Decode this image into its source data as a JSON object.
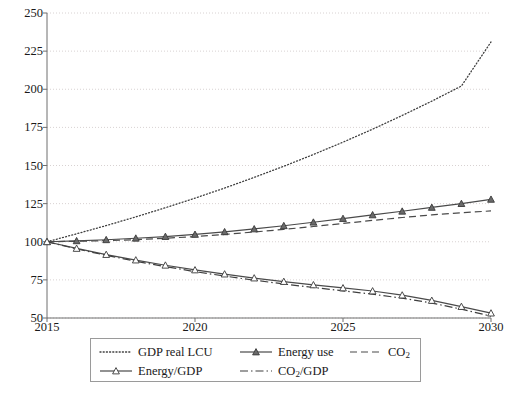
{
  "chart_data": {
    "type": "line",
    "title": "",
    "xlabel": "",
    "ylabel": "",
    "xlim": [
      2015,
      2030
    ],
    "ylim": [
      50,
      250
    ],
    "grid": true,
    "legend_position": "bottom",
    "x": [
      2015,
      2016,
      2017,
      2018,
      2019,
      2020,
      2021,
      2022,
      2023,
      2024,
      2025,
      2026,
      2027,
      2028,
      2029,
      2030
    ],
    "y_ticks": [
      50,
      75,
      100,
      125,
      150,
      175,
      200,
      225,
      250
    ],
    "x_ticks": [
      2015,
      2020,
      2025,
      2030
    ],
    "x_tick_labels": [
      "2015",
      "2020",
      "2025",
      "2030"
    ],
    "series": [
      {
        "name": "GDP real LCU",
        "style": "dotted",
        "marker": "none",
        "color": "#3f3f3f",
        "values": [
          100,
          105.2,
          110.6,
          116.3,
          122.3,
          128.6,
          135.2,
          142.2,
          149.5,
          157.2,
          165.3,
          173.8,
          182.8,
          192.2,
          202.1,
          231.0
        ]
      },
      {
        "name": "Energy use",
        "style": "solid",
        "marker": "filled-triangle",
        "color": "#4a4a4a",
        "values": [
          100,
          100.6,
          101.3,
          102.3,
          103.4,
          104.8,
          106.5,
          108.4,
          110.5,
          112.8,
          115.2,
          117.6,
          120.0,
          122.5,
          125.0,
          127.8
        ]
      },
      {
        "name": "CO2",
        "style": "dashed",
        "marker": "none",
        "color": "#4a4a4a",
        "values": [
          100,
          100.3,
          100.7,
          101.4,
          102.3,
          103.4,
          104.8,
          106.4,
          108.1,
          110.0,
          112.0,
          114.0,
          115.9,
          117.6,
          119.0,
          120.2
        ]
      },
      {
        "name": "Energy/GDP",
        "style": "solid",
        "marker": "open-triangle",
        "color": "#4a4a4a",
        "values": [
          100,
          95.6,
          91.6,
          88.0,
          84.6,
          81.5,
          78.8,
          76.2,
          73.9,
          71.7,
          69.7,
          67.7,
          65.0,
          61.5,
          57.5,
          53.2
        ]
      },
      {
        "name": "CO2/GDP",
        "style": "dash-dot",
        "marker": "none",
        "color": "#3f3f3f",
        "values": [
          100,
          95.3,
          91.1,
          87.2,
          83.7,
          80.4,
          77.5,
          74.8,
          72.3,
          70.0,
          67.8,
          65.6,
          63.0,
          59.8,
          55.8,
          51.2
        ]
      }
    ]
  },
  "axes": {
    "y_tick_labels": [
      "250",
      "225",
      "200",
      "175",
      "150",
      "125",
      "100",
      "75",
      "50"
    ],
    "x_tick_labels": [
      "2015",
      "2020",
      "2025",
      "2030"
    ]
  },
  "legend": {
    "items": [
      {
        "label": "GDP real LCU",
        "key": "dotted-line-key"
      },
      {
        "label": "Energy use",
        "key": "solid-filled-triangle-key"
      },
      {
        "label": "CO",
        "sub": "2",
        "key": "dashed-line-key"
      },
      {
        "label": "Energy/GDP",
        "key": "solid-open-triangle-key"
      },
      {
        "label": "CO",
        "sub": "2",
        "suffix": "/GDP",
        "key": "dash-dot-line-key"
      }
    ]
  },
  "colors": {
    "axis": "#6e6e6e",
    "grid": "#d8d2d2",
    "series_dark": "#3f3f3f",
    "series_mid": "#4a4a4a",
    "text": "#1a1a1a",
    "legend_border": "#9a9a9a",
    "background": "#ffffff"
  }
}
